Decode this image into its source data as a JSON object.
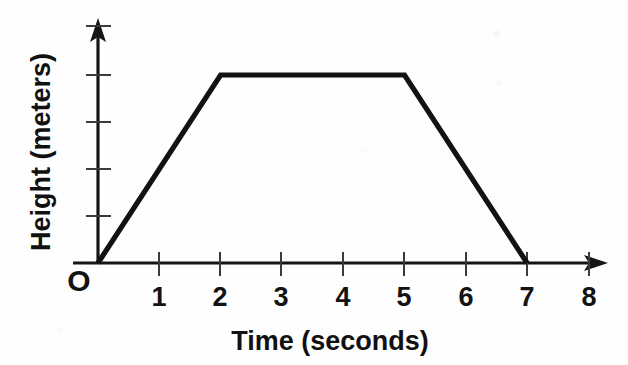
{
  "chart_data": {
    "type": "line",
    "title": "",
    "subtitle": "",
    "xlabel": "Time (seconds)",
    "ylabel": "Height (meters)",
    "origin_label": "O",
    "x": [
      0,
      2,
      5,
      7
    ],
    "values": [
      0,
      4,
      4,
      0
    ],
    "series": [
      {
        "name": "Height vs Time",
        "points": [
          {
            "x": 0,
            "y": 0
          },
          {
            "x": 2,
            "y": 4
          },
          {
            "x": 5,
            "y": 4
          },
          {
            "x": 7,
            "y": 0
          }
        ]
      }
    ],
    "xlim": [
      0,
      8
    ],
    "ylim": [
      0,
      5
    ],
    "xticks": [
      1,
      2,
      3,
      4,
      5,
      6,
      7,
      8
    ],
    "xtick_labels": [
      "1",
      "2",
      "3",
      "4",
      "5",
      "6",
      "7",
      "8"
    ],
    "yticks": [
      1,
      2,
      3,
      4,
      5
    ],
    "ytick_labels": [
      "",
      "",
      "",
      "",
      ""
    ],
    "grid": false,
    "legend": false,
    "legend_position": "none",
    "x_axis_arrow": true,
    "y_axis_arrow": true,
    "line_color": "#121212",
    "axis_color": "#151515",
    "background_color": "#fefefe",
    "annotations": []
  },
  "axis": {
    "x_title": "Time (seconds)",
    "y_title": "Height (meters)",
    "origin": "O"
  },
  "xtick_labels": {
    "t1": "1",
    "t2": "2",
    "t3": "3",
    "t4": "4",
    "t5": "5",
    "t6": "6",
    "t7": "7",
    "t8": "8"
  }
}
